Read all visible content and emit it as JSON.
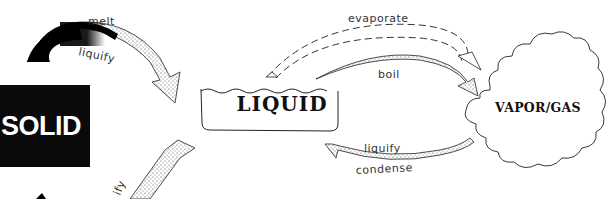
{
  "diagram": {
    "type": "phase-change-cycle",
    "states": {
      "solid": "SOLID",
      "liquid": "LIQUID",
      "vapor": "VAPOR/GAS"
    },
    "transitions": [
      {
        "from": "solid",
        "to": "liquid",
        "labels": [
          "melt",
          "liquify"
        ],
        "style": "gradient-stippled"
      },
      {
        "from": "liquid",
        "to": "vapor",
        "labels": [
          "evaporate"
        ],
        "style": "dashed"
      },
      {
        "from": "liquid",
        "to": "vapor",
        "labels": [
          "boil"
        ],
        "style": "stippled"
      },
      {
        "from": "vapor",
        "to": "liquid",
        "labels": [
          "liquify",
          "condense"
        ],
        "style": "stippled"
      },
      {
        "from": "liquid",
        "to": "solid",
        "labels": [
          "...ify"
        ],
        "style": "stippled-partial"
      }
    ],
    "labels": {
      "melt": "melt",
      "liquify_top": "liquify",
      "evaporate": "evaporate",
      "boil": "boil",
      "liquify_bottom": "liquify",
      "condense": "condense",
      "ify_partial": "ify"
    },
    "colors": {
      "ink": "#111111",
      "solid_fill": "#0a0a0a",
      "stipple": "#d8d8d8",
      "background": "#ffffff"
    }
  }
}
